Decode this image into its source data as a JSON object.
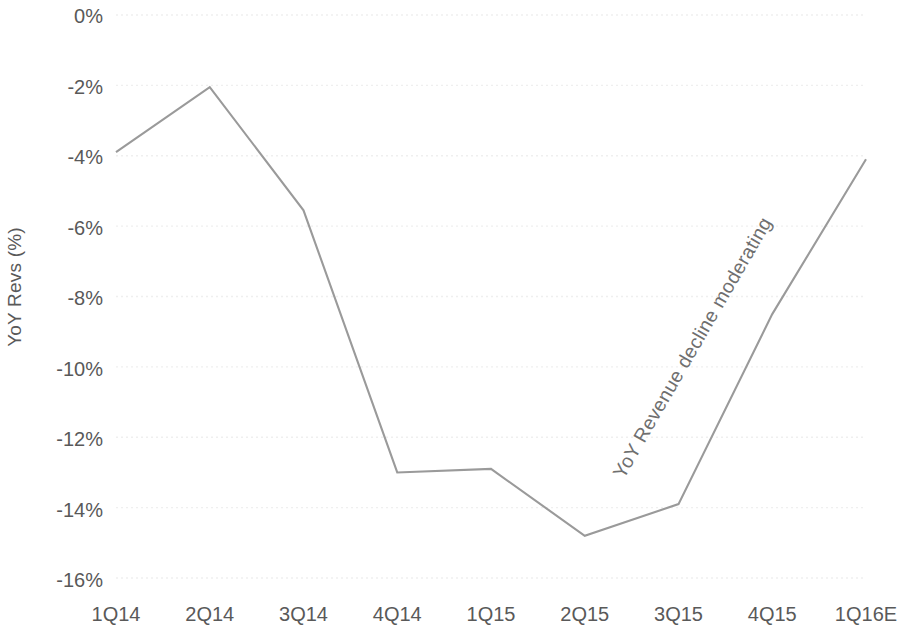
{
  "chart_data": {
    "type": "line",
    "title": "",
    "subtitle": "",
    "xlabel": "",
    "ylabel": "YoY Revs  (%)",
    "categories": [
      "1Q14",
      "2Q14",
      "3Q14",
      "4Q14",
      "1Q15",
      "2Q15",
      "3Q15",
      "4Q15",
      "1Q16E"
    ],
    "values": [
      -3.9,
      -2.05,
      -5.55,
      -13.0,
      -12.9,
      -14.8,
      -13.9,
      -8.5,
      -4.1
    ],
    "series": [
      {
        "name": "YoY Revs (%)",
        "values": [
          -3.9,
          -2.05,
          -5.55,
          -13.0,
          -12.9,
          -14.8,
          -13.9,
          -8.5,
          -4.1
        ]
      }
    ],
    "ylim": [
      -16,
      0
    ],
    "ytick_labels": [
      "0%",
      "-2%",
      "-4%",
      "-6%",
      "-8%",
      "-10%",
      "-12%",
      "-14%",
      "-16%"
    ],
    "ytick_values": [
      0,
      -2,
      -4,
      -6,
      -8,
      -10,
      -12,
      -14,
      -16
    ],
    "grid": true,
    "legend": "none",
    "line_color": "#9a9a9a",
    "text_color": "#595959",
    "grid_color": "#efefef",
    "annotations": [
      {
        "text": "YoY Revenue decline moderating",
        "rotation_deg": -60,
        "color": "#6f6f6f"
      }
    ]
  },
  "axis": {
    "y_title": "YoY Revs  (%)"
  }
}
